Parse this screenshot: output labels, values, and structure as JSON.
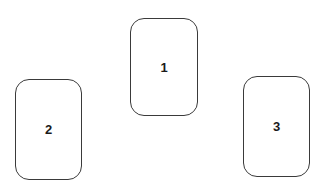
{
  "diagram": {
    "background": "#ffffff",
    "stroke_color": "#3a3a3a",
    "cards": [
      {
        "id": "1",
        "label": "1"
      },
      {
        "id": "2",
        "label": "2"
      },
      {
        "id": "3",
        "label": "3"
      }
    ]
  }
}
